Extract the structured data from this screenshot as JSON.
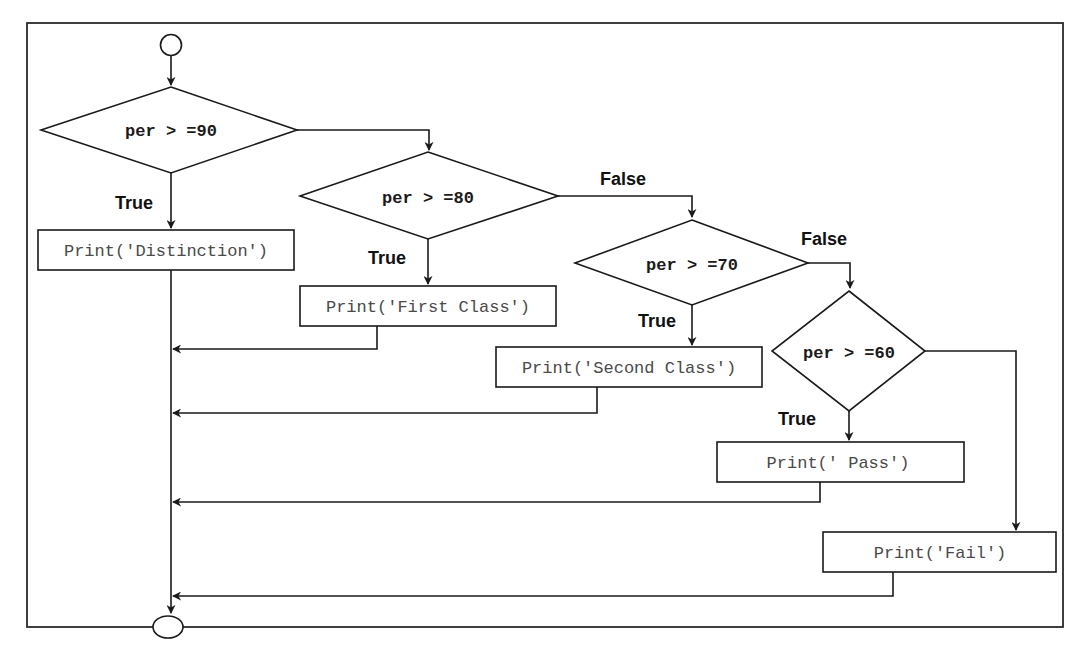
{
  "diagram": {
    "type": "flowchart",
    "title": "",
    "colors": {
      "stroke": "#1a1a1a",
      "text": "#1a1a1a",
      "box_text": "#4a4a4a",
      "background": "#ffffff"
    },
    "terminals": {
      "start": {
        "label": "",
        "shape": "circle"
      },
      "end": {
        "label": "",
        "shape": "ellipse"
      }
    },
    "decisions": [
      {
        "id": "d90",
        "text": "per > =90",
        "true_label": "True",
        "false_label": ""
      },
      {
        "id": "d80",
        "text": "per > =80",
        "true_label": "True",
        "false_label": "False"
      },
      {
        "id": "d70",
        "text": "per > =70",
        "true_label": "True",
        "false_label": "False"
      },
      {
        "id": "d60",
        "text": "per > =60",
        "true_label": "True",
        "false_label": ""
      }
    ],
    "processes": [
      {
        "id": "p_dist",
        "text": "Print('Distinction')"
      },
      {
        "id": "p_first",
        "text": "Print('First Class')"
      },
      {
        "id": "p_second",
        "text": "Print('Second Class')"
      },
      {
        "id": "p_pass",
        "text": "Print(' Pass')"
      },
      {
        "id": "p_fail",
        "text": "Print('Fail')"
      }
    ],
    "edges": [
      {
        "from": "start",
        "to": "d90",
        "label": ""
      },
      {
        "from": "d90",
        "to": "p_dist",
        "label": "True"
      },
      {
        "from": "d90",
        "to": "d80",
        "label": ""
      },
      {
        "from": "d80",
        "to": "p_first",
        "label": "True"
      },
      {
        "from": "d80",
        "to": "d70",
        "label": "False"
      },
      {
        "from": "d70",
        "to": "p_second",
        "label": "True"
      },
      {
        "from": "d70",
        "to": "d60",
        "label": "False"
      },
      {
        "from": "d60",
        "to": "p_pass",
        "label": "True"
      },
      {
        "from": "d60",
        "to": "p_fail",
        "label": ""
      },
      {
        "from": "p_dist",
        "to": "end",
        "label": ""
      },
      {
        "from": "p_first",
        "to": "end",
        "label": ""
      },
      {
        "from": "p_second",
        "to": "end",
        "label": ""
      },
      {
        "from": "p_pass",
        "to": "end",
        "label": ""
      },
      {
        "from": "p_fail",
        "to": "end",
        "label": ""
      }
    ]
  }
}
